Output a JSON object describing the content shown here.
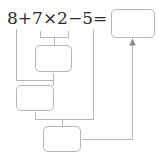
{
  "expression": {
    "text": "8+7×2−5=",
    "operands": [
      "8",
      "7",
      "2",
      "5"
    ],
    "operators": [
      "+",
      "×",
      "−",
      "="
    ]
  },
  "colors": {
    "line": "#b6b6b6",
    "text": "#2b2b2b",
    "arrow": "#8a8a8a",
    "background": "#ffffff"
  },
  "boxes": {
    "answer": {
      "label": "",
      "name": "answer-box"
    },
    "step1": {
      "label": "",
      "name": "step1-box"
    },
    "step2": {
      "label": "",
      "name": "step2-box"
    },
    "step3": {
      "label": "",
      "name": "step3-box"
    }
  },
  "connectors": {
    "multiply_bracket": "bracket under 7×2 feeding step1 box",
    "from_8": "vertical line from 8 joining step2 box",
    "from_step1": "line from step1 box down into step2 box",
    "from_5": "vertical line from 5 down to step3 box row",
    "from_step2": "line from step2 box right into step3 box",
    "to_answer": "line from step3 box right then up with arrow into answer box"
  }
}
